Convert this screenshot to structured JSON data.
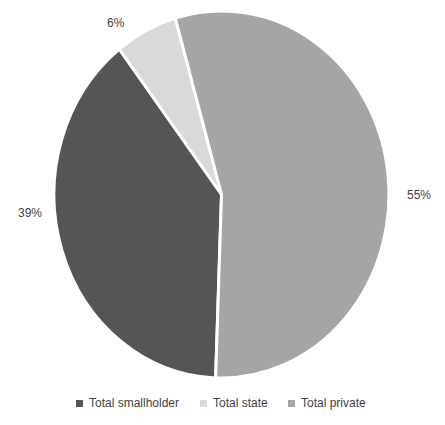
{
  "chart_data": {
    "type": "pie",
    "title": "",
    "categories": [
      "Total smallholder",
      "Total state",
      "Total private"
    ],
    "values": [
      39,
      6,
      55
    ],
    "value_labels": [
      "39%",
      "6%",
      "55%"
    ],
    "unit": "%",
    "colors": [
      "#555555",
      "#d9d9d9",
      "#a5a5a5"
    ],
    "slice_border_color": "#ffffff",
    "start_angle_deg": 182,
    "direction": "clockwise",
    "legend_position": "bottom",
    "label_color": "#3f3f3f",
    "background_color": "#ffffff"
  }
}
